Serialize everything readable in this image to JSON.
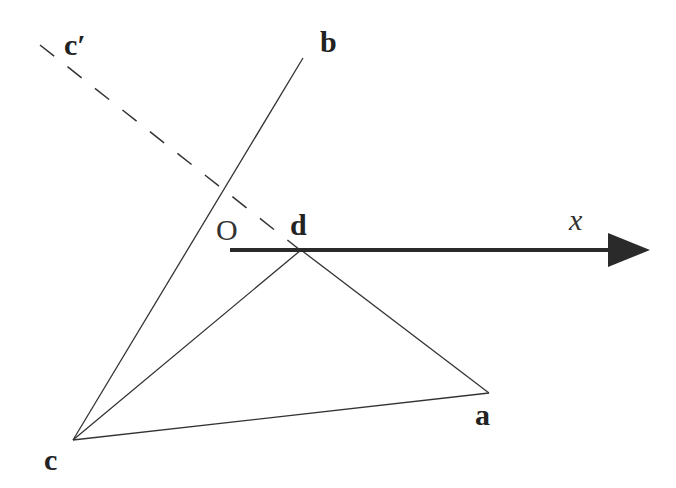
{
  "diagram": {
    "labels": {
      "c_prime": "c′",
      "b": "b",
      "O": "O",
      "d": "d",
      "x": "x",
      "a": "a",
      "c": "c"
    },
    "colors": {
      "line": "#333333",
      "axis": "#2a2a2a",
      "background": "#ffffff"
    },
    "elements": [
      {
        "id": "line-c-b",
        "from": "c",
        "to": "b",
        "style": "solid"
      },
      {
        "id": "line-c-d",
        "from": "c",
        "to": "d",
        "style": "solid"
      },
      {
        "id": "line-c-a",
        "from": "c",
        "to": "a",
        "style": "solid"
      },
      {
        "id": "line-d-a",
        "from": "d",
        "to": "a",
        "style": "solid"
      },
      {
        "id": "line-cprime-d",
        "from": "c′",
        "to": "d",
        "style": "dashed"
      },
      {
        "id": "x-axis",
        "from": "O",
        "to": "x",
        "style": "thick-arrow"
      }
    ]
  }
}
